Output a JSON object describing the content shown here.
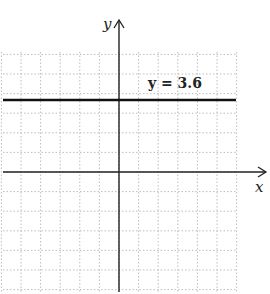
{
  "chart_data": {
    "type": "line",
    "title": "",
    "xlabel": "x",
    "ylabel": "y",
    "grid": true,
    "series": [
      {
        "name": "y = 3.6",
        "equation": "y = 3.6",
        "y": 3.6,
        "kind": "horizontal-line"
      }
    ],
    "annotations": [
      {
        "text": "y = 3.6"
      }
    ],
    "axis_ranges": {
      "x": [
        -6,
        6
      ],
      "y": [
        -6,
        6
      ]
    }
  },
  "labels": {
    "x_axis": "x",
    "y_axis": "y",
    "line_label": "y = 3.6"
  },
  "colors": {
    "axis": "#222222",
    "line": "#111111",
    "grid": "#b8b8b8"
  }
}
